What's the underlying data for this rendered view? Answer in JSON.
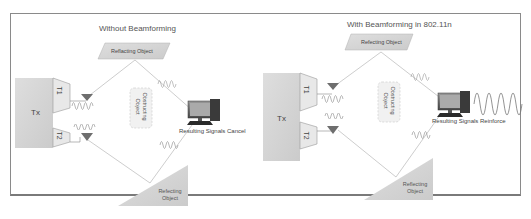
{
  "left_panel": {
    "title": "Without Beamforming",
    "top_reflector": "Reflacting Object",
    "bottom_reflector_line1": "Refecting",
    "bottom_reflector_line2": "Object",
    "transmitter": "Tx",
    "antenna1": "T1",
    "antenna2": "T2",
    "obstacle_line1": "Obstructing",
    "obstacle_line2": "Object",
    "result": "Resulting Signals Cancel"
  },
  "right_panel": {
    "title": "With Beamforming in 802.11n",
    "top_reflector": "Refecting Object",
    "bottom_reflector_line1": "Reflecting",
    "bottom_reflector_line2": "Object",
    "transmitter": "Tx",
    "antenna1": "T1",
    "antenna2": "T2",
    "obstacle_line1": "Obstructing",
    "obstacle_line2": "Object",
    "result": "Resulting Signals Reinforce"
  },
  "colors": {
    "border": "#8a8a8a",
    "block_fill": "#d4d4d4",
    "antenna_fill": "#6e6e6e",
    "line": "#b0b0b0",
    "wave": "#777777"
  }
}
